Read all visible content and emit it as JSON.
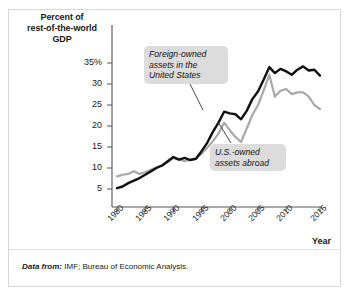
{
  "figure": {
    "y_axis_title": [
      "Percent of",
      "rest-of-the-world",
      "GDP"
    ],
    "x_axis_title": "Year",
    "footnote_lead": "Data from:",
    "footnote_text": "IMF; Bureau of Economic Analysis."
  },
  "annotations": {
    "foreign": "Foreign-owned assets in the United States",
    "usowned": "U.S.-owned assets abroad"
  },
  "colors": {
    "foreign_line": "#111111",
    "usowned_line": "#a9a9a9",
    "axis": "#555555",
    "callout_bg": "#dcdcdc",
    "frame": "#d8d8d8"
  },
  "chart_data": {
    "type": "line",
    "title": "",
    "subtitle": "",
    "xlabel": "Year",
    "ylabel": "Percent of rest-of-the-world GDP",
    "xlim": [
      1980,
      2016
    ],
    "ylim": [
      0,
      37
    ],
    "grid": false,
    "legend_position": "inline-annotations",
    "ytick_labels": [
      "35%",
      "30",
      "25",
      "20",
      "15",
      "10",
      "5"
    ],
    "ytick_values": [
      35,
      30,
      25,
      20,
      15,
      10,
      5
    ],
    "xtick_labels": [
      "1980",
      "1985",
      "1990",
      "1995",
      "2000",
      "2005",
      "2010",
      "2016"
    ],
    "xtick_values": [
      1980,
      1985,
      1990,
      1995,
      2000,
      2005,
      2010,
      2016
    ],
    "x": [
      1980,
      1981,
      1982,
      1983,
      1984,
      1985,
      1986,
      1987,
      1988,
      1989,
      1990,
      1991,
      1992,
      1993,
      1994,
      1995,
      1996,
      1997,
      1998,
      1999,
      2000,
      2001,
      2002,
      2003,
      2004,
      2005,
      2006,
      2007,
      2008,
      2009,
      2010,
      2011,
      2012,
      2013,
      2014,
      2015,
      2016
    ],
    "series": [
      {
        "name": "Foreign-owned assets in the United States",
        "color": "#111111",
        "values": [
          5.2,
          5.6,
          6.4,
          7.0,
          7.6,
          8.4,
          9.2,
          10.0,
          10.6,
          11.6,
          12.6,
          12.0,
          12.4,
          11.9,
          12.2,
          14.0,
          16.0,
          18.6,
          20.8,
          23.4,
          23.0,
          22.8,
          21.6,
          23.6,
          26.4,
          28.2,
          31.0,
          34.0,
          32.6,
          33.6,
          33.0,
          32.2,
          33.4,
          34.2,
          33.2,
          33.4,
          32.0
        ]
      },
      {
        "name": "U.S.-owned assets abroad",
        "color": "#a9a9a9",
        "values": [
          8.0,
          8.4,
          8.6,
          9.2,
          8.6,
          9.0,
          9.6,
          10.2,
          10.6,
          11.4,
          12.4,
          12.0,
          11.6,
          12.0,
          12.2,
          13.4,
          14.8,
          16.4,
          18.2,
          20.8,
          19.0,
          17.4,
          16.2,
          19.4,
          22.6,
          25.0,
          28.4,
          32.2,
          27.0,
          28.4,
          28.8,
          27.6,
          28.0,
          28.0,
          27.0,
          25.0,
          24.0
        ]
      }
    ]
  }
}
